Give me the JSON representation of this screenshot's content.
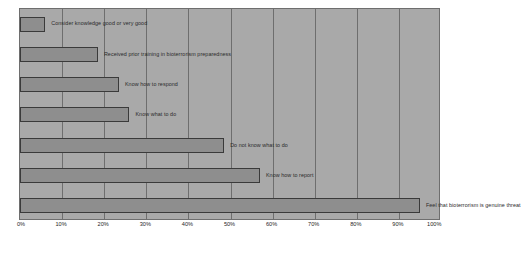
{
  "chart_data": {
    "type": "bar",
    "orientation": "horizontal",
    "title": "",
    "subtitle": "",
    "xlabel": "",
    "ylabel": "",
    "xlim": [
      0,
      100
    ],
    "grid": true,
    "legend": "none",
    "x_tick_labels": [
      "0%",
      "10%",
      "20%",
      "30%",
      "40%",
      "50%",
      "60%",
      "70%",
      "80%",
      "90%",
      "100%"
    ],
    "x_tick_values": [
      0,
      10,
      20,
      30,
      40,
      50,
      60,
      70,
      80,
      90,
      100
    ],
    "categories": [
      "Consider knowledge good or very good",
      "Received prior training in bioterrorism preparedness",
      "Know how to respond",
      "Know what to do",
      "Do not know what to do",
      "Know how to report",
      "Feel that bioterrorism is genuine threat"
    ],
    "values": [
      6,
      18.5,
      23.5,
      26,
      48.5,
      57,
      95
    ],
    "value_unit": "%",
    "series": [
      {
        "name": "Percent of respondents",
        "values": [
          6,
          18.5,
          23.5,
          26,
          48.5,
          57,
          95
        ]
      }
    ],
    "colors": {
      "plot_background": "#a9a9a9",
      "bar_fill": "#8e8e8e",
      "bar_border": "#3a3a3a",
      "gridline": "#6e6e6e",
      "text": "#2b2b2b",
      "figure_background": "#ffffff"
    }
  }
}
